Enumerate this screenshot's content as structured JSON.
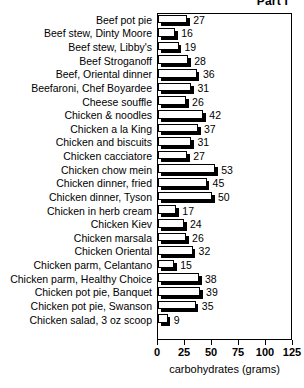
{
  "chart_data": {
    "type": "bar",
    "orientation": "horizontal",
    "title": "Part I",
    "xlabel": "carbohydrates (grams)",
    "ylabel": "",
    "xlim": [
      0,
      125
    ],
    "xticks": [
      0,
      25,
      50,
      75,
      100,
      125
    ],
    "xtick_labels": [
      "0",
      "25",
      "50",
      "75",
      "100",
      "125"
    ],
    "grid": false,
    "legend": null,
    "value_labels": true,
    "categories": [
      "Beef pot pie",
      "Beef stew, Dinty Moore",
      "Beef stew, Libby's",
      "Beef Stroganoff",
      "Beef, Oriental dinner",
      "Beefaroni, Chef Boyardee",
      "Cheese souffle",
      "Chicken & noodles",
      "Chicken a la King",
      "Chicken and biscuits",
      "Chicken cacciatore",
      "Chicken chow mein",
      "Chicken dinner, fried",
      "Chicken dinner, Tyson",
      "Chicken in herb cream",
      "Chicken Kiev",
      "Chicken marsala",
      "Chicken Oriental",
      "Chicken parm, Celantano",
      "Chicken parm, Healthy Choice",
      "Chicken pot pie, Banquet",
      "Chicken pot pie, Swanson",
      "Chicken salad, 3 oz scoop"
    ],
    "values": [
      27,
      16,
      19,
      28,
      36,
      31,
      26,
      42,
      37,
      31,
      27,
      53,
      45,
      50,
      17,
      24,
      26,
      32,
      15,
      38,
      39,
      35,
      9
    ]
  },
  "colors": {
    "bar_fill": "#ffffff",
    "bar_outline": "#000000",
    "bar_shadow": "#000000",
    "axis": "#000000",
    "text": "#000000",
    "background": "#ffffff"
  }
}
